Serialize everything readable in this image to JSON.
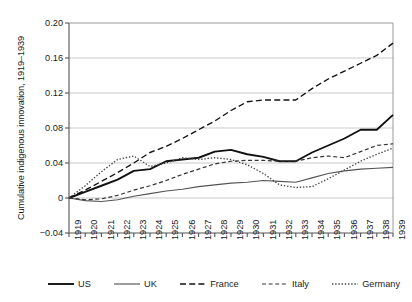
{
  "chart_data": {
    "type": "line",
    "title": "",
    "xlabel": "",
    "ylabel": "Cumulative indigenous innovation, 1919–1939",
    "x": [
      1919,
      1920,
      1921,
      1922,
      1923,
      1924,
      1925,
      1926,
      1927,
      1928,
      1929,
      1930,
      1931,
      1932,
      1933,
      1934,
      1935,
      1936,
      1937,
      1938,
      1939
    ],
    "xtick_labels": [
      "1919",
      "1920",
      "1921",
      "1922",
      "1923",
      "1924",
      "1925",
      "1926",
      "1927",
      "1928",
      "1929",
      "1930",
      "1931",
      "1932",
      "1933",
      "1934",
      "1935",
      "1936",
      "1937",
      "1938",
      "1939"
    ],
    "ytick_labels": [
      "0.20",
      "0.16",
      "0.12",
      "0.08",
      "0.04",
      "0",
      "−0.04"
    ],
    "ytick_values": [
      0.2,
      0.16,
      0.12,
      0.08,
      0.04,
      0.0,
      -0.04
    ],
    "ylim": [
      -0.04,
      0.2
    ],
    "xlim": [
      1919,
      1939
    ],
    "grid": "horizontal",
    "legend_position": "bottom",
    "series": [
      {
        "name": "US",
        "style": "solid-thick",
        "color": "#111111",
        "values": [
          0.0,
          0.007,
          0.014,
          0.021,
          0.031,
          0.033,
          0.042,
          0.044,
          0.046,
          0.053,
          0.055,
          0.05,
          0.047,
          0.042,
          0.042,
          0.052,
          0.06,
          0.068,
          0.078,
          0.078,
          0.095
        ]
      },
      {
        "name": "UK",
        "style": "solid-thin",
        "color": "#555555",
        "values": [
          0.0,
          -0.003,
          -0.004,
          -0.002,
          0.002,
          0.005,
          0.008,
          0.01,
          0.013,
          0.015,
          0.017,
          0.018,
          0.02,
          0.019,
          0.018,
          0.023,
          0.028,
          0.031,
          0.033,
          0.034,
          0.035
        ]
      },
      {
        "name": "France",
        "style": "dashed-long",
        "color": "#111111",
        "values": [
          0.0,
          0.009,
          0.019,
          0.029,
          0.04,
          0.052,
          0.059,
          0.068,
          0.078,
          0.088,
          0.1,
          0.11,
          0.112,
          0.112,
          0.112,
          0.125,
          0.136,
          0.145,
          0.154,
          0.163,
          0.177
        ]
      },
      {
        "name": "Italy",
        "style": "dashed-short",
        "color": "#333333",
        "values": [
          0.0,
          -0.002,
          -0.001,
          0.003,
          0.009,
          0.014,
          0.02,
          0.027,
          0.033,
          0.039,
          0.042,
          0.043,
          0.043,
          0.042,
          0.042,
          0.046,
          0.048,
          0.046,
          0.053,
          0.06,
          0.062
        ]
      },
      {
        "name": "Germany",
        "style": "dotted",
        "color": "#444444",
        "values": [
          0.0,
          0.014,
          0.03,
          0.044,
          0.048,
          0.036,
          0.04,
          0.046,
          0.044,
          0.046,
          0.044,
          0.038,
          0.028,
          0.015,
          0.012,
          0.013,
          0.022,
          0.032,
          0.042,
          0.05,
          0.057
        ]
      }
    ]
  }
}
